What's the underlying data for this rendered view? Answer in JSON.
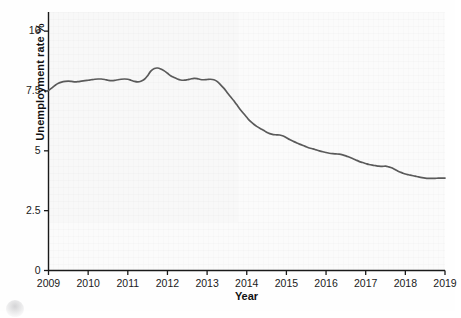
{
  "figure": {
    "background_color": "#fefefe",
    "plot_background_color": "#fbfbfb",
    "line_color": "#5a5a5a",
    "axis_color": "#1a1a1a"
  },
  "axes": {
    "ylabel": "Unemployment rate %",
    "xlabel": "Year",
    "y_ticks": [
      "0",
      "2.5",
      "5",
      "7.5",
      "10"
    ],
    "x_ticks": [
      "2009",
      "2010",
      "2011",
      "2012",
      "2013",
      "2014",
      "2015",
      "2016",
      "2017",
      "2018",
      "2019"
    ]
  },
  "decoration": {
    "corner_mark": "partial-circle-artifact"
  },
  "chart_data": {
    "type": "line",
    "title": "",
    "xlabel": "Year",
    "ylabel": "Unemployment rate %",
    "xlim": [
      2009,
      2019
    ],
    "ylim": [
      0,
      10.8
    ],
    "yticks": [
      0,
      2.5,
      5,
      7.5,
      10
    ],
    "xticks": [
      2009,
      2010,
      2011,
      2012,
      2013,
      2014,
      2015,
      2016,
      2017,
      2018,
      2019
    ],
    "grid": false,
    "legend": "none",
    "series": [
      {
        "name": "Unemployment rate %",
        "color": "#5a5a5a",
        "x": [
          2009.0,
          2009.08,
          2009.17,
          2009.25,
          2009.33,
          2009.42,
          2009.5,
          2009.58,
          2009.67,
          2009.75,
          2009.83,
          2009.92,
          2010.0,
          2010.08,
          2010.17,
          2010.25,
          2010.33,
          2010.42,
          2010.5,
          2010.58,
          2010.67,
          2010.75,
          2010.83,
          2010.92,
          2011.0,
          2011.08,
          2011.17,
          2011.25,
          2011.33,
          2011.42,
          2011.5,
          2011.58,
          2011.67,
          2011.75,
          2011.83,
          2011.92,
          2012.0,
          2012.08,
          2012.17,
          2012.25,
          2012.33,
          2012.42,
          2012.5,
          2012.58,
          2012.67,
          2012.75,
          2012.83,
          2012.92,
          2013.0,
          2013.08,
          2013.17,
          2013.25,
          2013.33,
          2013.42,
          2013.5,
          2013.58,
          2013.67,
          2013.75,
          2013.83,
          2013.92,
          2014.0,
          2014.08,
          2014.17,
          2014.25,
          2014.33,
          2014.42,
          2014.5,
          2014.58,
          2014.67,
          2014.75,
          2014.83,
          2014.92,
          2015.0,
          2015.08,
          2015.17,
          2015.25,
          2015.33,
          2015.42,
          2015.5,
          2015.58,
          2015.67,
          2015.75,
          2015.83,
          2015.92,
          2016.0,
          2016.08,
          2016.17,
          2016.25,
          2016.33,
          2016.42,
          2016.5,
          2016.58,
          2016.67,
          2016.75,
          2016.83,
          2016.92,
          2017.0,
          2017.08,
          2017.17,
          2017.25,
          2017.33,
          2017.42,
          2017.5,
          2017.58,
          2017.67,
          2017.75,
          2017.83,
          2017.92,
          2018.0,
          2018.08,
          2018.17,
          2018.25,
          2018.33,
          2018.42,
          2018.5,
          2018.58,
          2018.67,
          2018.75,
          2018.83,
          2018.92,
          2019.0
        ],
        "y": [
          7.52,
          7.62,
          7.74,
          7.82,
          7.87,
          7.9,
          7.91,
          7.9,
          7.88,
          7.89,
          7.91,
          7.93,
          7.95,
          7.97,
          7.99,
          8.0,
          8.0,
          7.98,
          7.95,
          7.93,
          7.94,
          7.97,
          7.99,
          8.0,
          7.99,
          7.95,
          7.9,
          7.88,
          7.91,
          7.99,
          8.14,
          8.33,
          8.44,
          8.46,
          8.42,
          8.34,
          8.24,
          8.14,
          8.06,
          8.0,
          7.96,
          7.95,
          7.97,
          8.0,
          8.03,
          8.02,
          7.98,
          7.97,
          7.98,
          7.99,
          7.97,
          7.9,
          7.78,
          7.62,
          7.45,
          7.28,
          7.1,
          6.92,
          6.74,
          6.56,
          6.4,
          6.25,
          6.12,
          6.02,
          5.94,
          5.86,
          5.78,
          5.72,
          5.68,
          5.67,
          5.66,
          5.62,
          5.55,
          5.47,
          5.4,
          5.34,
          5.28,
          5.22,
          5.17,
          5.12,
          5.08,
          5.04,
          5.0,
          4.96,
          4.93,
          4.9,
          4.88,
          4.87,
          4.86,
          4.83,
          4.79,
          4.74,
          4.68,
          4.62,
          4.56,
          4.51,
          4.47,
          4.43,
          4.4,
          4.38,
          4.36,
          4.35,
          4.36,
          4.33,
          4.28,
          4.21,
          4.14,
          4.08,
          4.03,
          4.0,
          3.97,
          3.94,
          3.91,
          3.88,
          3.86,
          3.85,
          3.85,
          3.85,
          3.86,
          3.86,
          3.86
        ]
      }
    ]
  }
}
